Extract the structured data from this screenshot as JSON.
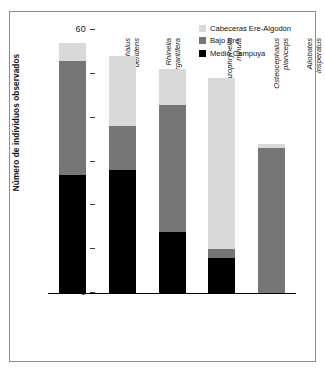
{
  "chart_data": {
    "type": "bar",
    "subtype": "stacked-bar",
    "title": "",
    "xlabel": "",
    "ylabel": "Número de individuos observados",
    "ylim": [
      0,
      60
    ],
    "yticks": [
      0,
      10,
      20,
      30,
      40,
      50,
      60
    ],
    "grid": false,
    "legend_position": "top-right",
    "categories": [
      "Osteocephalus deridens",
      "Rhinella margaritifera",
      "Amazophrynella minuta",
      "Osteocephalus planiceps",
      "Allobates insperatus"
    ],
    "category_lines": [
      [
        "Osteocephalus",
        "deridens"
      ],
      [
        "Rhinella",
        "margaritifera"
      ],
      [
        "Amazophrynella",
        "minuta"
      ],
      [
        "Osteocephalus",
        "planiceps"
      ],
      [
        "Allobates",
        "insperatus"
      ]
    ],
    "series": [
      {
        "name": "Medio Campuya",
        "color": "#000000",
        "values": [
          27,
          28,
          14,
          8,
          0
        ]
      },
      {
        "name": "Bajo Ere",
        "color": "#767676",
        "values": [
          26,
          10,
          29,
          2,
          33
        ]
      },
      {
        "name": "Cabeceras Ere-Algodón",
        "color": "#d9d9d9",
        "values": [
          4,
          16,
          8,
          39,
          1
        ]
      }
    ],
    "totals": [
      57,
      54,
      51,
      49,
      34
    ]
  },
  "legend": {
    "items": [
      {
        "label": "Cabeceras Ere-Algodón",
        "color": "#d9d9d9"
      },
      {
        "label": "Bajo Ere",
        "color": "#767676"
      },
      {
        "label": "Medio Campuya",
        "color": "#000000"
      }
    ]
  }
}
